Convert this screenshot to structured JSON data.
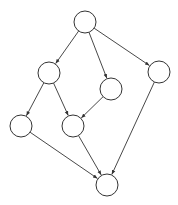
{
  "diagram": {
    "type": "directed-acyclic-graph",
    "node_radius": 11,
    "colors": {
      "stroke": "#333333",
      "fill": "#ffffff",
      "background": "#ffffff"
    },
    "nodes": [
      {
        "id": "n0",
        "label": "",
        "x": 85,
        "y": 22
      },
      {
        "id": "n1",
        "label": "",
        "x": 49,
        "y": 73
      },
      {
        "id": "n2",
        "label": "",
        "x": 111,
        "y": 89
      },
      {
        "id": "n3",
        "label": "",
        "x": 159,
        "y": 72
      },
      {
        "id": "n4",
        "label": "",
        "x": 21,
        "y": 126
      },
      {
        "id": "n5",
        "label": "",
        "x": 73,
        "y": 126
      },
      {
        "id": "n6",
        "label": "",
        "x": 107,
        "y": 185
      }
    ],
    "edges": [
      {
        "from": "n0",
        "to": "n1"
      },
      {
        "from": "n0",
        "to": "n2"
      },
      {
        "from": "n0",
        "to": "n3"
      },
      {
        "from": "n1",
        "to": "n4"
      },
      {
        "from": "n1",
        "to": "n5"
      },
      {
        "from": "n2",
        "to": "n5"
      },
      {
        "from": "n4",
        "to": "n6"
      },
      {
        "from": "n5",
        "to": "n6"
      },
      {
        "from": "n3",
        "to": "n6"
      }
    ]
  }
}
